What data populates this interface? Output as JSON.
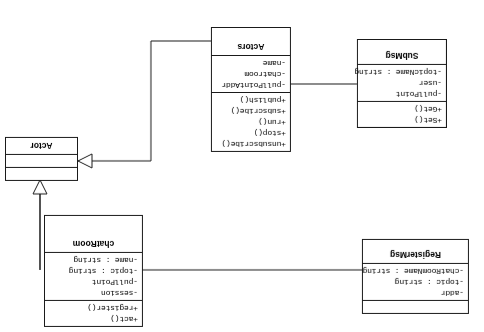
{
  "diagram": {
    "orientation": "rotated-180",
    "stroke_color": "#1a1a1a",
    "background_color": "#ffffff"
  },
  "classes": [
    {
      "id": "registermsg",
      "name": "RegisterMsg",
      "attributes": [
        "-chatRoomName : string",
        "-topic : string",
        "-addr"
      ],
      "methods": []
    },
    {
      "id": "chatroom",
      "name": "chatRoom",
      "attributes": [
        "-name : string",
        "-topic : string",
        "-pullPoint",
        "-session"
      ],
      "methods": [
        "+register()",
        "+act()"
      ]
    },
    {
      "id": "actor",
      "name": "Actor",
      "attributes": [],
      "methods": []
    },
    {
      "id": "submsg",
      "name": "SubMsg",
      "attributes": [
        "-topicName : string",
        "-user",
        "-pullPoint"
      ],
      "methods": [
        "+Get()",
        "+Set()"
      ]
    },
    {
      "id": "actors",
      "name": "Actors",
      "attributes": [
        "-name",
        "-chatroom",
        "-pullPointAddr"
      ],
      "methods": [
        "+publish()",
        "+subscribe()",
        "+run()",
        "+stop()",
        "+unsubscribe()"
      ]
    }
  ],
  "relationships": [
    {
      "id": "registermsg-chatroom",
      "from": "RegisterMsg",
      "to": "chatRoom",
      "type": "association",
      "arrow": "none"
    },
    {
      "id": "chatroom-actor",
      "from": "chatRoom",
      "to": "Actor",
      "type": "generalization",
      "arrow": "hollow-triangle"
    },
    {
      "id": "submsg-actors",
      "from": "SubMsg",
      "to": "Actors",
      "type": "association",
      "arrow": "none"
    },
    {
      "id": "actors-actor",
      "from": "Actors",
      "to": "Actor",
      "type": "generalization",
      "arrow": "hollow-triangle"
    }
  ]
}
